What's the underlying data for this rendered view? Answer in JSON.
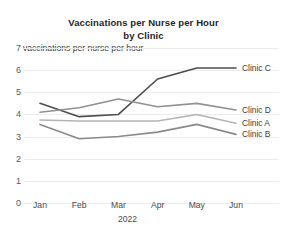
{
  "chart_data": {
    "type": "line",
    "title": "Vaccinations per Nurse per Hour by Clinic",
    "title_lines": [
      "Vaccinations per Nurse per Hour",
      "by Clinic"
    ],
    "ylabel": "vaccinations per nurse per hour",
    "xlabel": "2022",
    "categories": [
      "Jan",
      "Feb",
      "Mar",
      "Apr",
      "May",
      "Jun"
    ],
    "yticks": [
      0,
      1,
      2,
      3,
      4,
      5,
      6,
      7
    ],
    "ytick_labels": [
      "0",
      "1",
      "2",
      "3",
      "4",
      "5",
      "6",
      "7"
    ],
    "ylim": [
      0,
      7
    ],
    "grid": true,
    "legend_position": "right-inline",
    "series": [
      {
        "name": "Clinic C",
        "color": "#4d4d4d",
        "label_value": 6.1,
        "values": [
          4.5,
          3.9,
          4.0,
          5.6,
          6.1,
          6.1
        ]
      },
      {
        "name": "Clinic D",
        "color": "#919191",
        "label_value": 4.2,
        "values": [
          4.1,
          4.3,
          4.7,
          4.35,
          4.5,
          4.2
        ]
      },
      {
        "name": "Clinic A",
        "color": "#b4b4b4",
        "label_value": 3.6,
        "values": [
          3.75,
          3.7,
          3.7,
          3.7,
          4.0,
          3.6
        ]
      },
      {
        "name": "Clinic B",
        "color": "#8a8a8a",
        "label_value": 3.1,
        "values": [
          3.55,
          2.9,
          3.0,
          3.2,
          3.55,
          3.1
        ]
      }
    ]
  }
}
